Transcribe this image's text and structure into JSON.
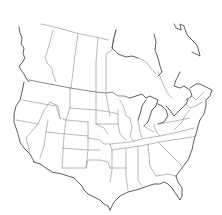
{
  "map": {
    "type": "blank outline map",
    "region": "United States and Canada",
    "style": "black line drawing on white, no labels",
    "colors": {
      "background": "#ffffff",
      "borders": "#8a8a8a",
      "coast": "#333333"
    }
  }
}
